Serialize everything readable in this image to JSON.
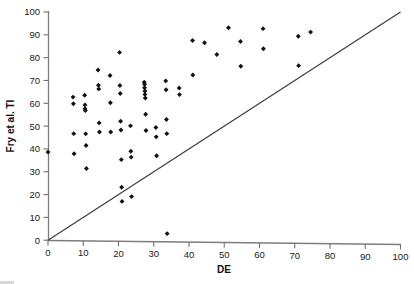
{
  "chart_data": {
    "type": "scatter",
    "title": "",
    "xlabel": "DE",
    "ylabel": "Fry et al. TI",
    "xlim": [
      0,
      100
    ],
    "ylim": [
      0,
      100
    ],
    "xticks": [
      0,
      10,
      20,
      30,
      40,
      50,
      60,
      70,
      80,
      90,
      100
    ],
    "yticks": [
      0,
      10,
      20,
      30,
      40,
      50,
      60,
      70,
      80,
      90,
      100
    ],
    "grid": false,
    "legend": false,
    "marker": "diamond",
    "marker_color": "#111111",
    "reference_line": {
      "label": "y = x identity line",
      "x": [
        0,
        100
      ],
      "y": [
        0,
        100
      ],
      "color": "#3a3a3a"
    },
    "series": [
      {
        "name": "Samples",
        "points": [
          [
            0.0,
            38.6
          ],
          [
            7.1,
            62.7
          ],
          [
            7.2,
            59.8
          ],
          [
            7.3,
            46.7
          ],
          [
            7.4,
            37.9
          ],
          [
            10.4,
            63.5
          ],
          [
            10.5,
            59.3
          ],
          [
            10.5,
            57.6
          ],
          [
            10.6,
            56.8
          ],
          [
            10.7,
            46.6
          ],
          [
            10.8,
            41.5
          ],
          [
            10.9,
            31.4
          ],
          [
            14.2,
            74.6
          ],
          [
            14.3,
            67.9
          ],
          [
            14.4,
            66.3
          ],
          [
            14.5,
            51.4
          ],
          [
            14.6,
            47.4
          ],
          [
            17.6,
            72.2
          ],
          [
            17.7,
            60.2
          ],
          [
            17.8,
            47.4
          ],
          [
            20.3,
            82.3
          ],
          [
            20.4,
            67.8
          ],
          [
            20.5,
            64.3
          ],
          [
            20.6,
            52.1
          ],
          [
            20.7,
            48.3
          ],
          [
            20.8,
            35.3
          ],
          [
            20.9,
            23.2
          ],
          [
            21.0,
            17.0
          ],
          [
            23.4,
            50.1
          ],
          [
            23.5,
            39.0
          ],
          [
            23.6,
            36.4
          ],
          [
            23.7,
            19.1
          ],
          [
            27.3,
            69.2
          ],
          [
            27.4,
            68.3
          ],
          [
            27.4,
            66.8
          ],
          [
            27.5,
            65.4
          ],
          [
            27.5,
            63.9
          ],
          [
            27.6,
            62.3
          ],
          [
            27.7,
            55.2
          ],
          [
            27.8,
            48.1
          ],
          [
            30.6,
            49.4
          ],
          [
            30.7,
            45.3
          ],
          [
            30.8,
            37.0
          ],
          [
            33.4,
            69.8
          ],
          [
            33.5,
            65.9
          ],
          [
            33.6,
            52.9
          ],
          [
            33.7,
            46.7
          ],
          [
            33.8,
            2.9
          ],
          [
            37.2,
            66.7
          ],
          [
            37.3,
            63.8
          ],
          [
            41.0,
            87.5
          ],
          [
            41.1,
            72.4
          ],
          [
            44.4,
            86.5
          ],
          [
            47.9,
            81.4
          ],
          [
            51.2,
            93.1
          ],
          [
            54.6,
            87.1
          ],
          [
            54.7,
            76.2
          ],
          [
            61.0,
            92.7
          ],
          [
            61.1,
            83.9
          ],
          [
            71.0,
            89.4
          ],
          [
            71.1,
            76.5
          ],
          [
            74.5,
            91.2
          ]
        ]
      }
    ]
  },
  "axes": {
    "x_tick_labels": [
      "0",
      "10",
      "20",
      "30",
      "40",
      "50",
      "60",
      "70",
      "80",
      "90",
      "100"
    ],
    "y_tick_labels": [
      "0",
      "10",
      "20",
      "30",
      "40",
      "50",
      "60",
      "70",
      "80",
      "90",
      "100"
    ],
    "x_title": "DE",
    "y_title": "Fry et al. TI"
  }
}
